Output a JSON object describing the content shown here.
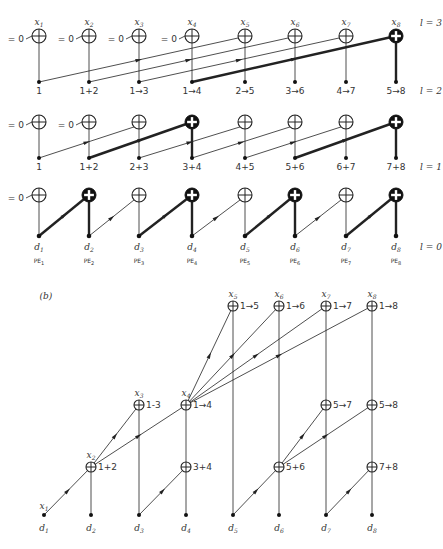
{
  "diagram_a": {
    "columns_x": [
      39,
      89,
      139,
      192,
      245,
      295,
      346,
      396
    ],
    "level_labels": [
      {
        "text": "l = 3",
        "x": 420,
        "y": 26
      },
      {
        "text": "l = 2",
        "x": 420,
        "y": 94
      },
      {
        "text": "l = 1",
        "x": 420,
        "y": 170
      },
      {
        "text": "l = 0",
        "x": 420,
        "y": 250
      }
    ],
    "top_inputs": [
      "x1",
      "x2",
      "x3",
      "x4",
      "x5",
      "x6",
      "x7",
      "x8"
    ],
    "zero_input_label": "= 0",
    "row3_labels": [
      "1",
      "1+2",
      "1→3",
      "1→4",
      "2→5",
      "3→6",
      "4→7",
      "5→8"
    ],
    "row2_labels": [
      "1",
      "1+2",
      "2+3",
      "3+4",
      "4+5",
      "5+6",
      "6+7",
      "7+8"
    ],
    "data_labels": [
      "d1",
      "d2",
      "d3",
      "d4",
      "d5",
      "d6",
      "d7",
      "d8"
    ],
    "pe_labels": [
      "PE1",
      "PE2",
      "PE3",
      "PE4",
      "PE5",
      "PE6",
      "PE7",
      "PE8"
    ]
  },
  "diagram_b": {
    "panel_label": "(b)",
    "nodes": [
      {
        "id": "x5",
        "label": "x5",
        "result": "1→5"
      },
      {
        "id": "x6",
        "label": "x6",
        "result": "1→6"
      },
      {
        "id": "x7",
        "label": "x7",
        "result": "1→7"
      },
      {
        "id": "x8",
        "label": "x8",
        "result": "1→8"
      },
      {
        "id": "x3",
        "label": "x3",
        "result": "1-3"
      },
      {
        "id": "x4",
        "label": "x4",
        "result": "1→4"
      },
      {
        "id": "n57",
        "label": "",
        "result": "5→7"
      },
      {
        "id": "n58",
        "label": "",
        "result": "5→8"
      },
      {
        "id": "x2",
        "label": "x2",
        "result": "1+2"
      },
      {
        "id": "n34",
        "label": "",
        "result": "3+4"
      },
      {
        "id": "n56",
        "label": "",
        "result": "5+6"
      },
      {
        "id": "n78",
        "label": "",
        "result": "7+8"
      }
    ],
    "x1_label": "x1",
    "data_labels": [
      "d1",
      "d2",
      "d3",
      "d4",
      "d5",
      "d6",
      "d7",
      "d8"
    ]
  }
}
